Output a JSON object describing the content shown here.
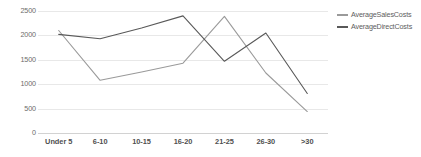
{
  "chart_data": {
    "type": "line",
    "title": "",
    "xlabel": "",
    "ylabel": "",
    "categories": [
      "Under 5",
      "6-10",
      "10-15",
      "16-20",
      "21-25",
      "26-30",
      ">30"
    ],
    "ylim": [
      0,
      2500
    ],
    "yticks": [
      0,
      500,
      1000,
      1500,
      2000,
      2500
    ],
    "ytick_labels": [
      "0",
      "500",
      "1000",
      "1500",
      "2000",
      "2500"
    ],
    "grid": true,
    "legend_position": "right",
    "series": [
      {
        "name": "AverageSalesCosts",
        "color": "#9a9a9a",
        "values": [
          2100,
          1080,
          1250,
          1430,
          2390,
          1230,
          440
        ]
      },
      {
        "name": "AverageDirectCosts",
        "color": "#595959",
        "values": [
          2020,
          1930,
          2150,
          2400,
          1470,
          2050,
          810
        ]
      }
    ]
  },
  "legend": {
    "items": [
      {
        "label": "AverageSalesCosts",
        "color": "#9a9a9a"
      },
      {
        "label": "AverageDirectCosts",
        "color": "#595959"
      }
    ]
  },
  "colors": {
    "gridline": "#e8e8e8",
    "axis": "#d2d2d2",
    "background": "#ffffff",
    "tick_text": "#6b6b6b"
  }
}
